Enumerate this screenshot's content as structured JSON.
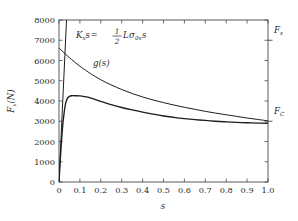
{
  "chart_data": {
    "type": "line",
    "title": "",
    "xlabel": "s",
    "ylabel": "Fx(N)",
    "xlim": [
      0,
      1.0
    ],
    "ylim": [
      0,
      8000
    ],
    "grid": false,
    "legend": "none",
    "xticks": [
      "0",
      "0.1",
      "0.2",
      "0.3",
      "0.4",
      "0.5",
      "0.6",
      "0.7",
      "0.8",
      "0.9",
      "1.0"
    ],
    "xtick_values": [
      0,
      0.1,
      0.2,
      0.3,
      0.4,
      0.5,
      0.6,
      0.7,
      0.8,
      0.9,
      1.0
    ],
    "yticks": [
      "0",
      "1000",
      "2000",
      "3000",
      "4000",
      "5000",
      "6000",
      "7000",
      "8000"
    ],
    "ytick_values": [
      0,
      1000,
      2000,
      3000,
      4000,
      5000,
      6000,
      7000,
      8000
    ],
    "right_axis_labels": [
      {
        "text": "Fs",
        "value": 7000
      },
      {
        "text": "FC",
        "value": 3000
      }
    ],
    "annotations": [
      {
        "name": "stiffness-equation",
        "text": "Kx s = 1/2 L sigma_0x s",
        "x": 0.22,
        "y": 7000
      },
      {
        "name": "g-function-label",
        "text": "g(s)",
        "x": 0.24,
        "y": 5200
      }
    ],
    "series": [
      {
        "name": "Kx s",
        "x": [
          0,
          0.004,
          0.008,
          0.012,
          0.016,
          0.02,
          0.024,
          0.028,
          0.032,
          0.036
        ],
        "values": [
          0,
          890,
          1780,
          2670,
          3560,
          4450,
          5340,
          6230,
          7120,
          8010
        ]
      },
      {
        "name": "g(s)",
        "x": [
          0,
          0.02,
          0.04,
          0.06,
          0.08,
          0.1,
          0.12,
          0.15,
          0.2,
          0.25,
          0.3,
          0.35,
          0.4,
          0.45,
          0.5,
          0.55,
          0.6,
          0.65,
          0.7,
          0.75,
          0.8,
          0.85,
          0.9,
          0.95,
          1.0
        ],
        "values": [
          6620,
          6420,
          6230,
          6050,
          5880,
          5720,
          5570,
          5360,
          5050,
          4790,
          4570,
          4370,
          4200,
          4050,
          3920,
          3800,
          3690,
          3590,
          3490,
          3400,
          3320,
          3240,
          3160,
          3090,
          3020
        ]
      },
      {
        "name": "Fx",
        "x": [
          0,
          0.005,
          0.01,
          0.015,
          0.02,
          0.03,
          0.04,
          0.05,
          0.06,
          0.08,
          0.1,
          0.12,
          0.15,
          0.2,
          0.25,
          0.3,
          0.35,
          0.4,
          0.45,
          0.5,
          0.55,
          0.6,
          0.65,
          0.7,
          0.75,
          0.8,
          0.85,
          0.9,
          0.95,
          1.0
        ],
        "values": [
          0,
          900,
          1720,
          2430,
          3020,
          3800,
          4130,
          4230,
          4260,
          4260,
          4250,
          4220,
          4150,
          3980,
          3820,
          3680,
          3560,
          3450,
          3350,
          3260,
          3190,
          3130,
          3080,
          3040,
          3000,
          2970,
          2945,
          2925,
          2910,
          2900
        ]
      }
    ]
  },
  "equation": {
    "lhs_K": "K",
    "lhs_K_sub": "x",
    "lhs_s": "s",
    "equals": "=",
    "num": "1",
    "den": "2",
    "rhs_L": "L",
    "rhs_sigma": "σ",
    "rhs_sigma_sub": "0x",
    "rhs_s": "s"
  },
  "labels": {
    "g_of_s": "g(s)",
    "F_s": "F",
    "F_s_sub": "s",
    "F_C": "F",
    "F_C_sub": "C",
    "y_axis": "Fx(N)",
    "y_axis_F": "F",
    "y_axis_x": "x",
    "y_axis_unit": "(N)",
    "x_axis": "s"
  }
}
